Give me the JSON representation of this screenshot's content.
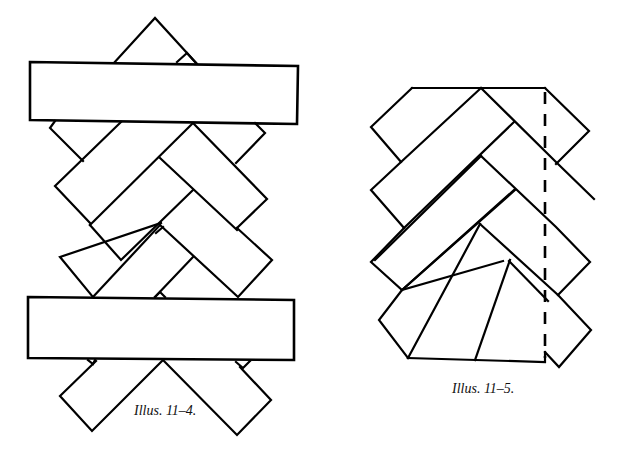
{
  "figures": [
    {
      "id": "illus-11-4",
      "caption": "Illus. 11–4.",
      "description": "Braid of diagonal strips crossed by two horizontal bands; hidden strip edges shown dashed"
    },
    {
      "id": "illus-11-5",
      "caption": "Illus. 11–5.",
      "description": "Herringbone braid of diagonal strips trimmed top and bottom, with a dashed vertical cut line on the right"
    }
  ],
  "colors": {
    "stroke": "#000000",
    "background": "#ffffff"
  }
}
